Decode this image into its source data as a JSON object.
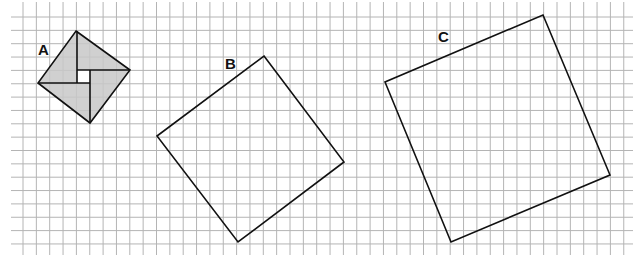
{
  "diagram": {
    "type": "grid-squares",
    "background": "#ffffff",
    "grid": {
      "origin_x": 23,
      "origin_y": 17,
      "spacing": 13.35,
      "cols": 46,
      "rows": 18,
      "x_start": 11,
      "x_end": 633,
      "y_start": 2,
      "y_end": 255,
      "color": "#b4b4b4"
    },
    "shapes": [
      {
        "id": "A",
        "label": "A",
        "label_pos": [
          38,
          55
        ],
        "fill": "#c8c8c8",
        "stroke": "#111111",
        "vertices": [
          [
            76,
            31
          ],
          [
            130,
            70
          ],
          [
            90,
            123
          ],
          [
            38,
            83
          ]
        ],
        "inner_square": [
          [
            77,
            70
          ],
          [
            90,
            70
          ],
          [
            90,
            83
          ],
          [
            77,
            83
          ]
        ],
        "inner_lines": [
          [
            [
              77,
              31
            ],
            [
              77,
              83
            ]
          ],
          [
            [
              77,
              70
            ],
            [
              130,
              70
            ]
          ],
          [
            [
              90,
              70
            ],
            [
              90,
              123
            ]
          ],
          [
            [
              38,
              83
            ],
            [
              90,
              83
            ]
          ]
        ]
      },
      {
        "id": "B",
        "label": "B",
        "label_pos": [
          225,
          69
        ],
        "fill": "none",
        "stroke": "#111111",
        "vertices": [
          [
            264,
            56
          ],
          [
            344,
            162
          ],
          [
            238,
            242
          ],
          [
            157,
            136
          ]
        ]
      },
      {
        "id": "C",
        "label": "C",
        "label_pos": [
          438,
          42
        ],
        "fill": "none",
        "stroke": "#111111",
        "vertices": [
          [
            543,
            15
          ],
          [
            610,
            175
          ],
          [
            451,
            242
          ],
          [
            385,
            82
          ]
        ]
      }
    ]
  }
}
